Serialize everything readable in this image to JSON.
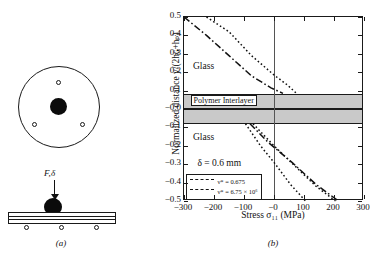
{
  "figure": {
    "panel_a": {
      "caption": "(a)",
      "force_label": "F,δ",
      "elements": {
        "plate_top_view": "circular laminated glass plate",
        "impactor": "steel ball impactor",
        "supports_count": 3
      }
    },
    "panel_b": {
      "caption": "(b)",
      "annotations": {
        "glass_upper": "Glass",
        "glass_lower": "Glass",
        "interlayer": "Polymer Interlayer",
        "delta": "δ = 0.6 mm"
      },
      "legend": {
        "entries": [
          {
            "style": "dotted",
            "label_html": "ν* = 0.675"
          },
          {
            "style": "dash-dot",
            "label_html": "ν* = 6.75 × 10⁶"
          }
        ]
      }
    }
  },
  "chart_data": {
    "type": "line",
    "title": "",
    "xlabel": "Stress σ₁₁ (MPa)",
    "ylabel": "Normalized distance y/(2hɢ+hₚ)",
    "xlim": [
      -300,
      300
    ],
    "ylim": [
      -0.5,
      0.5
    ],
    "xticks": [
      -300,
      -200,
      -100,
      0,
      100,
      200,
      300
    ],
    "xticklabels": [
      "−300",
      "−200",
      "−100",
      "−0",
      "100",
      "200",
      "300"
    ],
    "yticks": [
      0.5,
      0.4,
      0.3,
      0.2,
      0.1,
      -0.0,
      -0.1,
      -0.2,
      -0.3,
      -0.4,
      -0.5
    ],
    "yticklabels": [
      "0.5",
      "0.4",
      "0.3",
      "0.2",
      "0.1",
      "−0.0",
      "−0.1",
      "−0.2",
      "−0.3",
      "−0.4",
      "−0.5"
    ],
    "grid": false,
    "legend_position": "lower left",
    "zero_line_x": 0,
    "bands": [
      {
        "name": "Polymer Interlayer",
        "y_from": -0.08,
        "y_to": 0.08,
        "color": "#c9c9c9"
      },
      {
        "name": "interlayer mid-plane line",
        "y": 0.0,
        "color": "#1a1a1a"
      }
    ],
    "series": [
      {
        "name": "ν* = 0.675 (upper glass)",
        "style": "dotted",
        "x": [
          -225,
          -150,
          -75,
          0,
          45,
          75
        ],
        "y": [
          0.5,
          0.42,
          0.29,
          0.185,
          0.13,
          0.085
        ]
      },
      {
        "name": "ν* = 6.75 × 10⁶ (upper glass)",
        "style": "dash-dot",
        "x": [
          -300,
          -225,
          -150,
          -75,
          -10,
          30
        ],
        "y": [
          0.5,
          0.4,
          0.29,
          0.18,
          0.115,
          0.085
        ]
      },
      {
        "name": "ν* = 0.675 (lower glass)",
        "style": "dotted",
        "x": [
          -95,
          -45,
          0,
          55,
          105
        ],
        "y": [
          -0.08,
          -0.2,
          -0.29,
          -0.41,
          -0.5
        ]
      },
      {
        "name": "ν* = 6.75 × 10⁶ (lower glass)",
        "style": "dash-dot",
        "x": [
          -80,
          -20,
          60,
          140,
          215
        ],
        "y": [
          -0.08,
          -0.18,
          -0.29,
          -0.41,
          -0.5
        ]
      },
      {
        "name": "ν* = 0.675 (lower glass, second branch)",
        "style": "dotted",
        "x": [
          -70,
          0,
          70,
          140,
          205
        ],
        "y": [
          -0.08,
          -0.2,
          -0.31,
          -0.42,
          -0.5
        ]
      }
    ]
  }
}
